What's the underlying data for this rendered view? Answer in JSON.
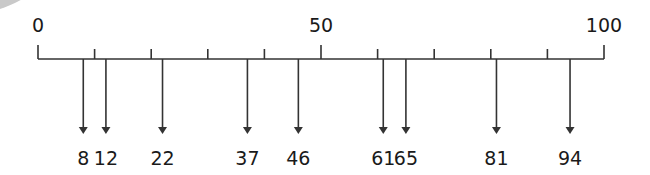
{
  "chart_data": {
    "type": "number_line",
    "title": "",
    "range": [
      0,
      100
    ],
    "major_tick_interval": 10,
    "axis_labels": [
      {
        "value": 0,
        "label": "0"
      },
      {
        "value": 50,
        "label": "50"
      },
      {
        "value": 100,
        "label": "100"
      }
    ],
    "marked_values": [
      8,
      12,
      22,
      37,
      46,
      61,
      65,
      81,
      94
    ],
    "marked_labels": [
      "8",
      "12",
      "22",
      "37",
      "46",
      "61",
      "65",
      "81",
      "94"
    ]
  },
  "colors": {
    "line": "#333333",
    "text": "#1a1a1a",
    "corner_shape": "#c9c9c9"
  }
}
